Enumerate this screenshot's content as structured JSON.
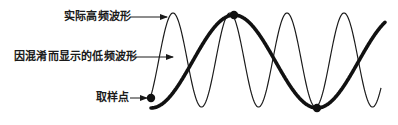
{
  "labels": {
    "actual": "实际高频波形",
    "aliased": "因混淆而显示的低频波形",
    "sample": "取样点"
  },
  "colors": {
    "ink": "#1a1a1a",
    "background": "#ffffff"
  },
  "waves": {
    "actual_high_freq": {
      "stroke_width": 1.2,
      "x_start": 151,
      "x_end": 381,
      "peak_x": 173,
      "period_px": 57,
      "y_top": 13,
      "y_bottom": 107
    },
    "aliased_low_freq": {
      "stroke_width": 3.6,
      "x_start": 151,
      "x_end": 385,
      "peak_x": 234,
      "period_px": 166,
      "y_top": 15,
      "y_bottom": 108
    }
  },
  "sample_points": [
    {
      "x": 151,
      "y": 98
    },
    {
      "x": 234,
      "y": 15
    },
    {
      "x": 317,
      "y": 108
    }
  ]
}
